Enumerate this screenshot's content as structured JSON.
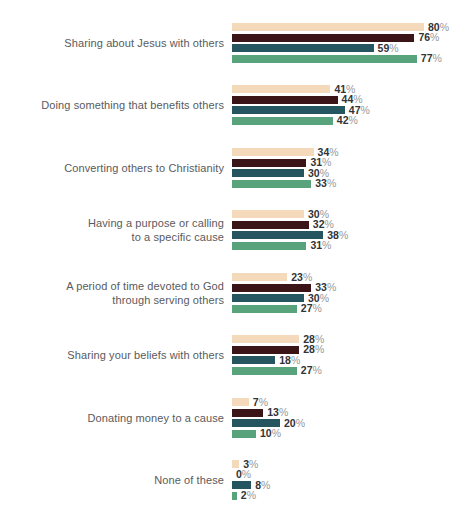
{
  "chart_data": {
    "type": "bar",
    "orientation": "horizontal",
    "title": "",
    "xlabel": "",
    "ylabel": "",
    "unit": "%",
    "xlim": [
      0,
      100
    ],
    "grid": false,
    "legend": "none-visible (cropped at top edge)",
    "value_labels": true,
    "categories": [
      {
        "label": "Sharing about Jesus with others",
        "display": "Sharing about Jesus with others"
      },
      {
        "label": "Doing something that benefits others",
        "display": "Doing something that benefits others"
      },
      {
        "label": "Converting others to Christianity",
        "display": "Converting others to Christianity"
      },
      {
        "label": "Having a purpose or calling to a specific cause",
        "display": "Having a purpose or calling\nto a specific cause"
      },
      {
        "label": "A period of time devoted to God through serving others",
        "display": "A period of time devoted to God\nthrough serving others"
      },
      {
        "label": "Sharing your beliefs with others",
        "display": "Sharing your beliefs with others"
      },
      {
        "label": "Donating money to a cause",
        "display": "Donating money to a cause"
      },
      {
        "label": "None of these",
        "display": "None of these"
      }
    ],
    "series": [
      {
        "name": "",
        "color": "#f4d9bb",
        "values": [
          80,
          41,
          34,
          30,
          23,
          28,
          7,
          3
        ]
      },
      {
        "name": "",
        "color": "#3a1416",
        "values": [
          76,
          44,
          31,
          32,
          33,
          28,
          13,
          0
        ]
      },
      {
        "name": "",
        "color": "#25565f",
        "values": [
          59,
          47,
          30,
          38,
          30,
          18,
          20,
          8
        ]
      },
      {
        "name": "",
        "color": "#58a37b",
        "values": [
          77,
          42,
          33,
          31,
          27,
          27,
          10,
          2
        ]
      }
    ]
  },
  "colors": {
    "background": "#ffffff",
    "category_label": "#595a5d",
    "value_number": "#323336",
    "percent_sign": "#97989a"
  }
}
